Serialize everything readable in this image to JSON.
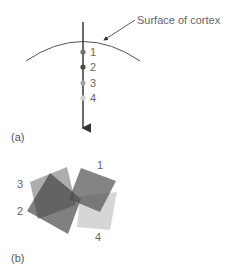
{
  "panel_a": {
    "label": "(a)",
    "annotation": "Surface of cortex",
    "electrode_sites": [
      {
        "label": "1",
        "color": "#6e6e6e"
      },
      {
        "label": "2",
        "color": "#4a4a4a"
      },
      {
        "label": "3",
        "color": "#a6a6a6"
      },
      {
        "label": "4",
        "color": "#cfcfcf"
      }
    ]
  },
  "panel_b": {
    "label": "(b)",
    "receptive_fields": [
      {
        "label": "1",
        "color": "#505050"
      },
      {
        "label": "2",
        "color": "#3c3c3c"
      },
      {
        "label": "3",
        "color": "#8a8a8a"
      },
      {
        "label": "4",
        "color": "#c8c8c8"
      }
    ]
  }
}
